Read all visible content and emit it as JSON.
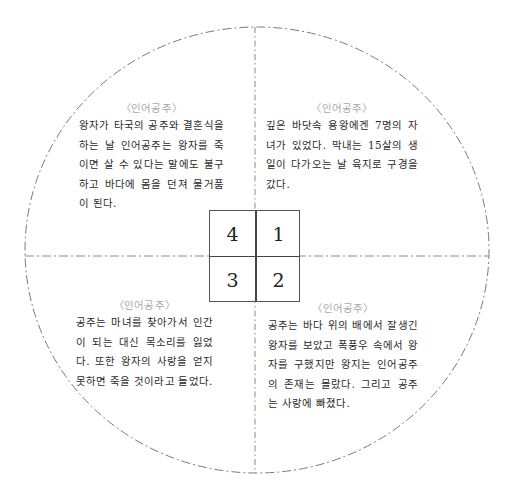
{
  "diagram": {
    "type": "quadrant-circle",
    "circle": {
      "cx": 256,
      "cy": 250,
      "rx": 232,
      "ry": 223,
      "style": "dash-dot",
      "color": "#777777"
    },
    "center_box": {
      "cells": [
        {
          "position": "top-left",
          "label": "4"
        },
        {
          "position": "top-right",
          "label": "1"
        },
        {
          "position": "bottom-left",
          "label": "3"
        },
        {
          "position": "bottom-right",
          "label": "2"
        }
      ]
    },
    "quadrants": [
      {
        "id": "1",
        "position": "top-right",
        "heading": "〈인어공주〉",
        "text": "깊은 바닷속 용왕에겐 7명의 자녀가 있었다. 막내는 15살의 생일이 다가오는 날 육지로 구경을 갔다."
      },
      {
        "id": "2",
        "position": "bottom-right",
        "heading": "〈인어공주〉",
        "text": "공주는 바다 위의 배에서 잘생긴 왕자를 보았고 폭풍우 속에서 왕자를 구했지만 왕지는 인어공주의 존재는 몰랐다. 그리고 공주는 사랑에 빠졌다."
      },
      {
        "id": "3",
        "position": "bottom-left",
        "heading": "〈인어공주〉",
        "text": "공주는 마녀를 찾아가서 인간이 되는 대신 목소리를 잃었다. 또한 왕자의 사랑을 얻지 못하면 죽을 것이라고 들었다."
      },
      {
        "id": "4",
        "position": "top-left",
        "heading": "〈인어공주〉",
        "text": "왕자가 타국의 공주와 결혼식을 하는 날 인어공주는 왕자를 죽이면 살 수 있다는 말에도 불구하고 바다에 몸을 던져 물거품이 된다."
      }
    ]
  }
}
